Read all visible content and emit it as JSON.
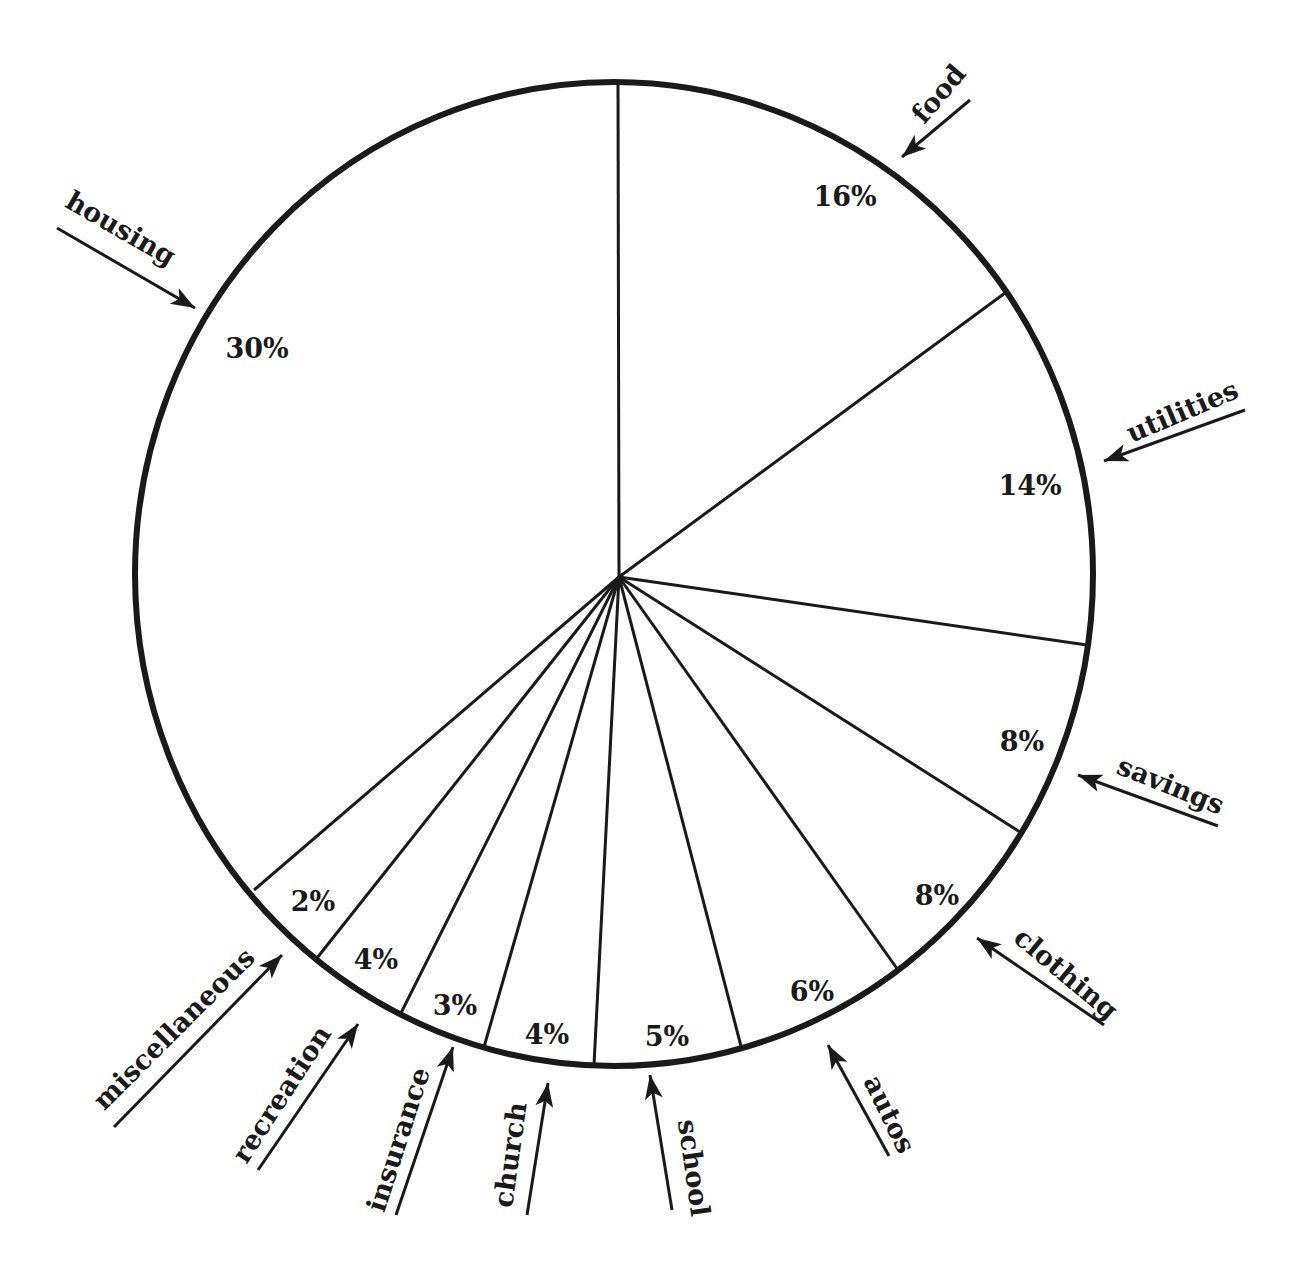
{
  "chart_data": {
    "type": "pie",
    "title": "",
    "start_angle_deg": 90,
    "direction": "clockwise",
    "legend": "none",
    "slices": [
      {
        "label": "food",
        "value": 16,
        "display": "16%"
      },
      {
        "label": "utilities",
        "value": 14,
        "display": "14%"
      },
      {
        "label": "savings",
        "value": 8,
        "display": "8%"
      },
      {
        "label": "clothing",
        "value": 8,
        "display": "8%"
      },
      {
        "label": "autos",
        "value": 6,
        "display": "6%"
      },
      {
        "label": "school",
        "value": 5,
        "display": "5%"
      },
      {
        "label": "church",
        "value": 4,
        "display": "4%"
      },
      {
        "label": "insurance",
        "value": 3,
        "display": "3%"
      },
      {
        "label": "recreation",
        "value": 4,
        "display": "4%"
      },
      {
        "label": "miscellaneous",
        "value": 2,
        "display": "2%"
      },
      {
        "label": "housing",
        "value": 30,
        "display": "30%"
      }
    ],
    "categories": [
      "food",
      "utilities",
      "savings",
      "clothing",
      "autos",
      "school",
      "church",
      "insurance",
      "recreation",
      "miscellaneous",
      "housing"
    ],
    "values": [
      16,
      14,
      8,
      8,
      6,
      5,
      4,
      3,
      4,
      2,
      30
    ]
  },
  "geometry": {
    "center": [
      619,
      577
    ],
    "rim_center": [
      614,
      574
    ],
    "rx": 479,
    "ry": 492,
    "boundaries": [
      [
        618,
        82
      ],
      [
        1005,
        293
      ],
      [
        1087,
        645
      ],
      [
        1020,
        832
      ],
      [
        898,
        970
      ],
      [
        742,
        1050
      ],
      [
        594,
        1065
      ],
      [
        484,
        1047
      ],
      [
        400,
        1015
      ],
      [
        317,
        958
      ],
      [
        254,
        890
      ]
    ],
    "percent_labels": [
      {
        "text": "16%",
        "x": 845,
        "y": 198
      },
      {
        "text": "14%",
        "x": 1030,
        "y": 487
      },
      {
        "text": "8%",
        "x": 1022,
        "y": 743
      },
      {
        "text": "8%",
        "x": 937,
        "y": 897
      },
      {
        "text": "6%",
        "x": 812,
        "y": 993
      },
      {
        "text": "5%",
        "x": 667,
        "y": 1038
      },
      {
        "text": "4%",
        "x": 547,
        "y": 1036
      },
      {
        "text": "3%",
        "x": 455,
        "y": 1007
      },
      {
        "text": "4%",
        "x": 376,
        "y": 961
      },
      {
        "text": "2%",
        "x": 313,
        "y": 903
      },
      {
        "text": "30%",
        "x": 257,
        "y": 350
      }
    ],
    "callouts": [
      {
        "text": "food",
        "tx": 940,
        "ty": 95,
        "rot": -50,
        "line": [
          [
            970,
            100
          ],
          [
            902,
            157
          ]
        ]
      },
      {
        "text": "housing",
        "tx": 120,
        "ty": 230,
        "rot": 30,
        "line": [
          [
            57,
            228
          ],
          [
            195,
            308
          ]
        ]
      },
      {
        "text": "utilities",
        "tx": 1183,
        "ty": 413,
        "rot": -23,
        "line": [
          [
            1245,
            410
          ],
          [
            1104,
            461
          ]
        ]
      },
      {
        "text": "savings",
        "tx": 1170,
        "ty": 787,
        "rot": 22,
        "line": [
          [
            1218,
            826
          ],
          [
            1078,
            775
          ]
        ]
      },
      {
        "text": "clothing",
        "tx": 1065,
        "ty": 975,
        "rot": 40,
        "line": [
          [
            1104,
            1025
          ],
          [
            977,
            938
          ]
        ]
      },
      {
        "text": "autos",
        "tx": 888,
        "ty": 1115,
        "rot": 64,
        "line": [
          [
            889,
            1156
          ],
          [
            828,
            1045
          ]
        ]
      },
      {
        "text": "school",
        "tx": 692,
        "ty": 1168,
        "rot": 82,
        "line": [
          [
            672,
            1210
          ],
          [
            650,
            1075
          ]
        ]
      },
      {
        "text": "church",
        "tx": 512,
        "ty": 1155,
        "rot": -82,
        "line": [
          [
            527,
            1215
          ],
          [
            548,
            1083
          ]
        ]
      },
      {
        "text": "insurance",
        "tx": 400,
        "ty": 1140,
        "rot": -72,
        "line": [
          [
            396,
            1215
          ],
          [
            453,
            1047
          ]
        ]
      },
      {
        "text": "recreation",
        "tx": 283,
        "ty": 1095,
        "rot": -57,
        "line": [
          [
            258,
            1170
          ],
          [
            358,
            1024
          ]
        ]
      },
      {
        "text": "miscellaneous",
        "tx": 175,
        "ty": 1030,
        "rot": -45,
        "line": [
          [
            114,
            1127
          ],
          [
            282,
            955
          ]
        ]
      }
    ]
  }
}
